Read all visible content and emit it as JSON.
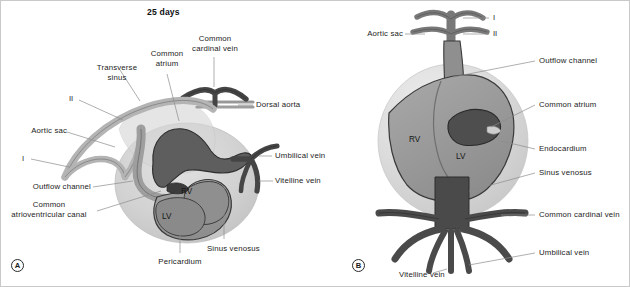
{
  "figure": {
    "title": "25 days",
    "background": "#ffffff",
    "width": 630,
    "height": 287
  },
  "palette": {
    "vessel_dark": "#4f4f4f",
    "vessel_mid": "#6f6f6f",
    "vessel_light": "#a3a3a3",
    "pericardium": "#cfcfcf",
    "pericardium_b": "#d9d9d9",
    "myocardium": "#9a9a9a",
    "endocardium": "#5a5a5a",
    "outline": "#2a2a2a",
    "leader_line": "#8c8c8c",
    "text": "#232323"
  },
  "panels": [
    {
      "id": "A",
      "mark": "A"
    },
    {
      "id": "B",
      "mark": "B"
    }
  ],
  "panel_a": {
    "mark": "A",
    "labels": [
      {
        "name": "transverse-sinus",
        "text": "Transverse\nsinus"
      },
      {
        "name": "common-atrium",
        "text": "Common\natrium"
      },
      {
        "name": "common-cardinal-vein",
        "text": "Common\ncardinal vein"
      },
      {
        "name": "arch-two",
        "text": "II"
      },
      {
        "name": "aortic-sac",
        "text": "Aortic sac"
      },
      {
        "name": "arch-one",
        "text": "I"
      },
      {
        "name": "outflow-channel",
        "text": "Outflow channel"
      },
      {
        "name": "common-atrioventricular-canal",
        "text": "Common\natrioventricular canal"
      },
      {
        "name": "dorsal-aorta",
        "text": "Dorsal aorta"
      },
      {
        "name": "umbilical-vein",
        "text": "Umbilical vein"
      },
      {
        "name": "vitelline-vein",
        "text": "Vitelline vein"
      },
      {
        "name": "sinus-venosus",
        "text": "Sinus venosus"
      },
      {
        "name": "pericardium",
        "text": "Pericardium"
      }
    ],
    "internal_labels": [
      {
        "name": "right-ventricle",
        "text": "RV"
      },
      {
        "name": "left-ventricle",
        "text": "LV"
      }
    ]
  },
  "panel_b": {
    "mark": "B",
    "labels": [
      {
        "name": "aortic-sac",
        "text": "Aortic sac"
      },
      {
        "name": "arch-one",
        "text": "I"
      },
      {
        "name": "arch-two",
        "text": "II"
      },
      {
        "name": "outflow-channel",
        "text": "Outflow channel"
      },
      {
        "name": "common-atrium",
        "text": "Common atrium"
      },
      {
        "name": "endocardium",
        "text": "Endocardium"
      },
      {
        "name": "sinus-venosus",
        "text": "Sinus venosus"
      },
      {
        "name": "common-cardinal-vein",
        "text": "Common cardinal vein"
      },
      {
        "name": "umbilical-vein",
        "text": "Umbilical vein"
      },
      {
        "name": "vitelline-vein",
        "text": "Vitelline vein"
      }
    ],
    "internal_labels": [
      {
        "name": "right-ventricle",
        "text": "RV"
      },
      {
        "name": "left-ventricle",
        "text": "LV"
      }
    ]
  }
}
